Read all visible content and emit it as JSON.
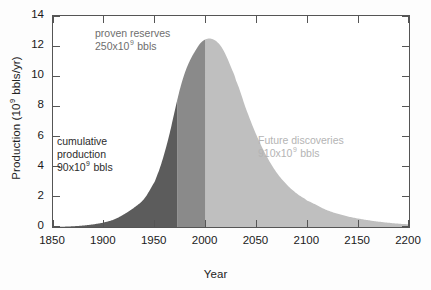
{
  "chart_data": {
    "type": "area",
    "title": "",
    "xlabel": "Year",
    "ylabel_text": "Production (10",
    "ylabel_sup": "9",
    "ylabel_tail": " bbls/yr)",
    "xlim": [
      1850,
      2200
    ],
    "ylim": [
      0,
      14
    ],
    "grid": false,
    "legend": "none",
    "xticks": [
      "1850",
      "1900",
      "1950",
      "2000",
      "2050",
      "2100",
      "2150",
      "2200"
    ],
    "xtick_values": [
      1850,
      1900,
      1950,
      2000,
      2050,
      2100,
      2150,
      2200
    ],
    "yticks": [
      "0",
      "2",
      "4",
      "6",
      "8",
      "10",
      "12",
      "14"
    ],
    "ytick_values": [
      0,
      2,
      4,
      6,
      8,
      10,
      12,
      14
    ],
    "x": [
      1850,
      1860,
      1870,
      1880,
      1890,
      1900,
      1910,
      1920,
      1930,
      1940,
      1950,
      1955,
      1960,
      1965,
      1970,
      1975,
      1980,
      1985,
      1990,
      1995,
      2000,
      2005,
      2010,
      2015,
      2020,
      2025,
      2030,
      2040,
      2050,
      2060,
      2070,
      2080,
      2090,
      2100,
      2120,
      2140,
      2160,
      2180,
      2200
    ],
    "y": [
      0.0,
      0.02,
      0.05,
      0.1,
      0.18,
      0.3,
      0.5,
      0.85,
      1.3,
      1.9,
      3.0,
      3.9,
      5.0,
      6.3,
      7.8,
      9.2,
      10.3,
      11.1,
      11.7,
      12.2,
      12.45,
      12.5,
      12.35,
      12.0,
      11.4,
      10.6,
      9.7,
      7.8,
      6.1,
      4.7,
      3.6,
      2.8,
      2.2,
      1.75,
      1.1,
      0.7,
      0.45,
      0.28,
      0.18
    ],
    "series": [
      {
        "name": "cumulative production",
        "x_range": [
          1850,
          1972
        ],
        "color": "#5c5c5c",
        "label": "cumulative production",
        "value_prefix": "90x10",
        "value_sup": "9",
        "value_unit": " bbls"
      },
      {
        "name": "proven reserves",
        "x_range": [
          1972,
          2000
        ],
        "color": "#8a8a8a",
        "label": "proven reserves",
        "value_prefix": "250x10",
        "value_sup": "9",
        "value_unit": " bbls"
      },
      {
        "name": "future discoveries",
        "x_range": [
          2000,
          2200
        ],
        "color": "#bfbfbf",
        "label": "Future discoveries",
        "value_prefix": "910x10",
        "value_sup": "9",
        "value_unit": " bbls"
      }
    ],
    "annotations": [
      {
        "id": "proven",
        "line1": "proven reserves",
        "line2_prefix": "250x10",
        "line2_sup": "9",
        "line2_tail": " bbls",
        "color": "#6e6e6e"
      },
      {
        "id": "cumulative",
        "line1": "cumulative",
        "line2": "production",
        "line3_prefix": "90x10",
        "line3_sup": "9",
        "line3_tail": " bbls",
        "color": "#2b2b2b"
      },
      {
        "id": "future",
        "line1": "Future discoveries",
        "line2_prefix": "910x10",
        "line2_sup": "9",
        "line2_tail": " bbls",
        "color": "#b4b4b4"
      }
    ],
    "colors": {
      "cumulative_production": "#5c5c5c",
      "proven_reserves": "#8a8a8a",
      "future_discoveries": "#bfbfbf",
      "axis": "#555555",
      "text": "#1a1a1a"
    }
  }
}
